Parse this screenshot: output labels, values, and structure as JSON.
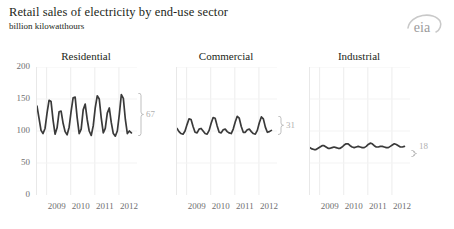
{
  "header": {
    "title": "Retail sales of electricity by end-use sector",
    "subtitle": "billion kilowatthours",
    "logo_text": "eia"
  },
  "chart_data": {
    "type": "line",
    "title": "Retail sales of electricity by end-use sector",
    "subtitle": "billion kilowatthours",
    "ylabel": "billion kilowatthours",
    "xlabel": "",
    "ylim": [
      0,
      200
    ],
    "yticks": [
      0,
      50,
      100,
      150,
      200
    ],
    "ytick_labels": [
      "0",
      "50",
      "100",
      "150",
      "200"
    ],
    "xticks": [
      2009,
      2010,
      2011,
      2012
    ],
    "xtick_labels": [
      "2009",
      "2010",
      "2011",
      "2012"
    ],
    "grid": "vertical-light",
    "legend": "none",
    "x_start": 2008.6,
    "x_end": 2012.75,
    "panels": [
      {
        "name": "Residential",
        "title": "Residential",
        "bracket_label": "67",
        "bracket_low": 92,
        "bracket_high": 159,
        "values": [
          139,
          120,
          101,
          96,
          104,
          128,
          148,
          146,
          117,
          95,
          105,
          130,
          131,
          112,
          99,
          94,
          106,
          131,
          152,
          153,
          121,
          96,
          103,
          133,
          142,
          118,
          100,
          93,
          108,
          136,
          155,
          150,
          120,
          97,
          104,
          128,
          136,
          113,
          96,
          92,
          100,
          126,
          157,
          151,
          118,
          96,
          100,
          97
        ]
      },
      {
        "name": "Commercial",
        "title": "Commercial",
        "bracket_label": "31",
        "bracket_low": 94,
        "bracket_high": 123,
        "values": [
          104,
          99,
          96,
          95,
          100,
          110,
          119,
          118,
          107,
          98,
          97,
          103,
          104,
          100,
          96,
          95,
          101,
          112,
          121,
          120,
          108,
          98,
          97,
          102,
          103,
          99,
          97,
          96,
          103,
          114,
          123,
          120,
          107,
          98,
          98,
          102,
          103,
          99,
          96,
          95,
          101,
          113,
          122,
          119,
          106,
          98,
          99,
          101
        ]
      },
      {
        "name": "Industrial",
        "title": "Industrial",
        "bracket_label": "18",
        "bracket_low": 70,
        "bracket_high": 81,
        "values": [
          74,
          72,
          71,
          71,
          73,
          75,
          77,
          77,
          75,
          73,
          73,
          74,
          75,
          74,
          73,
          73,
          75,
          78,
          80,
          80,
          77,
          75,
          74,
          75,
          76,
          75,
          74,
          74,
          76,
          79,
          81,
          80,
          77,
          75,
          75,
          76,
          76,
          75,
          74,
          74,
          76,
          78,
          80,
          79,
          77,
          75,
          75,
          76
        ]
      }
    ]
  }
}
